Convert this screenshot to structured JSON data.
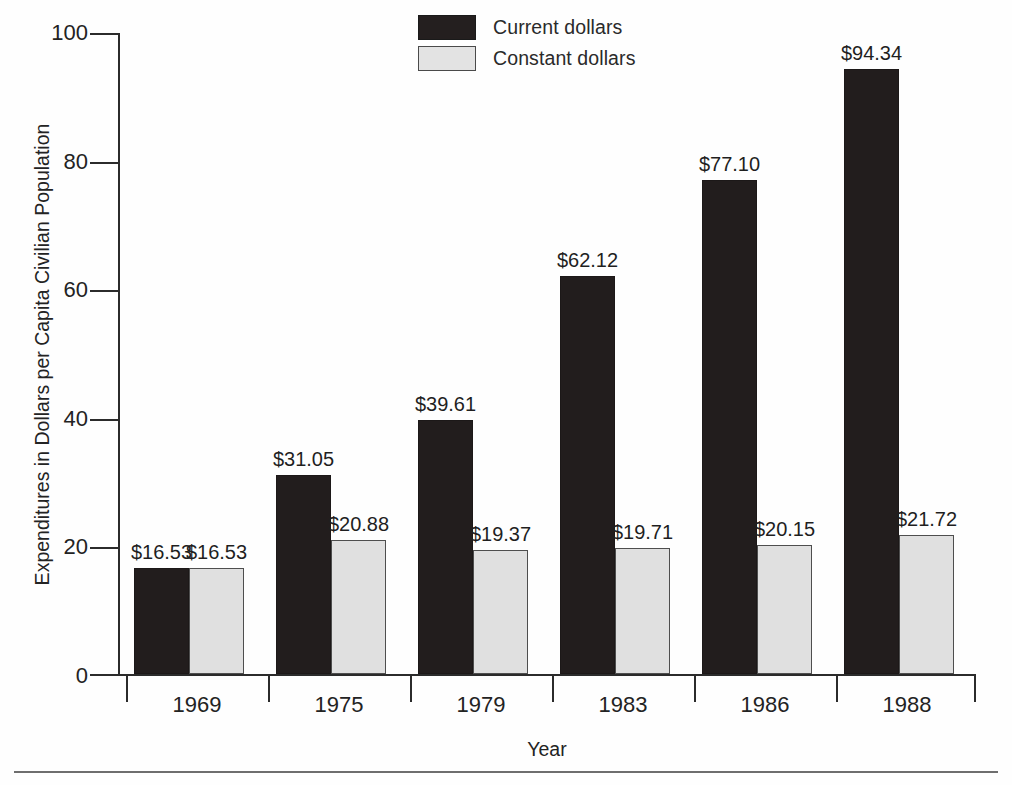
{
  "chart_data": {
    "type": "bar",
    "title": "",
    "subtitle": "",
    "xlabel": "Year",
    "ylabel": "Expenditures in Dollars per Capita Civilian Population",
    "categories": [
      "1969",
      "1975",
      "1979",
      "1983",
      "1986",
      "1988"
    ],
    "ylim": [
      0,
      100
    ],
    "yticks": [
      0,
      20,
      40,
      60,
      80,
      100
    ],
    "ytick_labels": [
      "0",
      "20",
      "40",
      "60",
      "80",
      "100"
    ],
    "grid": false,
    "legend_position": "top-center",
    "series": [
      {
        "name": "Current dollars",
        "color": "#221d1d",
        "values": [
          16.53,
          31.05,
          39.61,
          62.12,
          77.1,
          94.34
        ],
        "data_labels": [
          "$16.53",
          "$31.05",
          "$39.61",
          "$62.12",
          "$77.10",
          "$94.34"
        ]
      },
      {
        "name": "Constant dollars",
        "color": "#e0e0e0",
        "values": [
          16.53,
          20.88,
          19.37,
          19.71,
          20.15,
          21.72
        ],
        "data_labels": [
          "$16.53",
          "$20.88",
          "$19.37",
          "$19.71",
          "$20.15",
          "$21.72"
        ]
      }
    ]
  },
  "legend": {
    "items": [
      {
        "label": "Current dollars",
        "swatch": "dark"
      },
      {
        "label": "Constant dollars",
        "swatch": "light"
      }
    ]
  },
  "axes": {
    "y_title": "Expenditures in Dollars per Capita Civilian Population",
    "x_title": "Year",
    "y_tick_labels": [
      "100",
      "80",
      "60",
      "40",
      "20",
      "0"
    ],
    "x_tick_labels": [
      "1969",
      "1975",
      "1979",
      "1983",
      "1986",
      "1988"
    ]
  }
}
